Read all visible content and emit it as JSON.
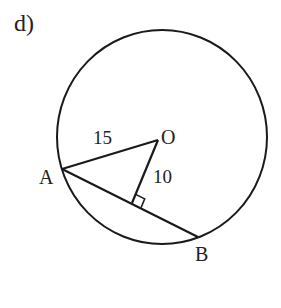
{
  "part_label": "d)",
  "points": {
    "center": "O",
    "a": "A",
    "b": "B"
  },
  "measurements": {
    "radius_OA": "15",
    "distance_O_to_chord": "10"
  },
  "colors": {
    "stroke": "#1a1a1a",
    "text": "#222222",
    "background": "#ffffff"
  }
}
